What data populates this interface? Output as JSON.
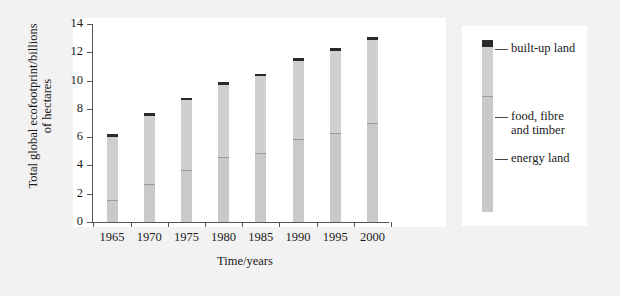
{
  "chart_data": {
    "type": "bar",
    "subtype": "stacked-bar",
    "title": "",
    "xlabel": "Time/years",
    "ylabel": "Total global ecofootprint/billions of hectares",
    "categories": [
      "1965",
      "1970",
      "1975",
      "1980",
      "1985",
      "1990",
      "1995",
      "2000"
    ],
    "ylim": [
      0,
      14
    ],
    "yticks": [
      "0",
      "2",
      "4",
      "6",
      "8",
      "10",
      "12",
      "14"
    ],
    "ytick_values": [
      0,
      2,
      4,
      6,
      8,
      10,
      12,
      14
    ],
    "grid": false,
    "legend_position": "right",
    "series": [
      {
        "name": "energy land",
        "color": "#c9c9c9",
        "values": [
          1.55,
          2.7,
          3.7,
          4.6,
          4.9,
          5.9,
          6.3,
          7.0
        ]
      },
      {
        "name": "food, fibre and timber",
        "color": "#cfcfcf",
        "values": [
          4.45,
          4.8,
          4.9,
          5.1,
          5.4,
          5.5,
          5.8,
          5.9
        ]
      },
      {
        "name": "built-up land",
        "color": "#2a2a2a",
        "values": [
          0.2,
          0.2,
          0.2,
          0.2,
          0.2,
          0.2,
          0.2,
          0.2
        ]
      }
    ],
    "totals": [
      6.2,
      7.7,
      8.8,
      9.9,
      10.5,
      11.6,
      12.3,
      13.1
    ]
  },
  "axes": {
    "ylabel_line1": "Total global ecofootprint/billions",
    "ylabel_line2": "of hectares",
    "xlabel": "Time/years"
  },
  "legend": {
    "items": [
      {
        "label": "built-up land",
        "color": "#2a2a2a"
      },
      {
        "label": "food, fibre\nand timber",
        "color": "#cfcfcf"
      },
      {
        "label": "energy land",
        "color": "#c9c9c9"
      }
    ]
  },
  "colors": {
    "background": "#f2f2f2",
    "panel": "#ffffff",
    "axis": "#555555",
    "text": "#1a1a1a",
    "energy_land": "#c9c9c9",
    "food_fibre_timber": "#cfcfcf",
    "built_up_land": "#2a2a2a"
  }
}
